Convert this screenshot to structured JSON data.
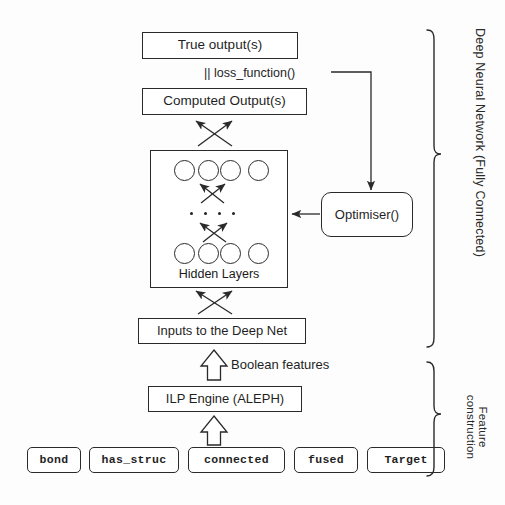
{
  "diagram": {
    "boxes": {
      "true_output": "True output(s)",
      "computed_output": "Computed Output(s)",
      "hidden_layers_caption": "Hidden Layers",
      "optimiser": "Optimiser()",
      "inputs_deep_net": "Inputs to the Deep Net",
      "ilp_engine": "ILP Engine (ALEPH)"
    },
    "labels": {
      "loss_function": "|| loss_function()",
      "boolean_features": "Boolean features"
    },
    "brackets": [
      {
        "name": "deep-neural-network",
        "label": "Deep Neural Network (Fully Connected)"
      },
      {
        "name": "feature-construction",
        "label": "Feature construction"
      }
    ],
    "feature_construction_label_lines": [
      "Feature",
      "construction"
    ],
    "predicates": [
      {
        "name": "bond",
        "label": "bond"
      },
      {
        "name": "has_struc",
        "label": "has_struc"
      },
      {
        "name": "connected",
        "label": "connected"
      },
      {
        "name": "fused",
        "label": "fused"
      },
      {
        "name": "target",
        "label": "Target"
      }
    ],
    "hidden_layer_nodes": {
      "top_row_count": 4,
      "bottom_row_count": 4,
      "ellipsis_dots": 4
    },
    "colors": {
      "stroke": "#2a2a2a",
      "text": "#1f1f1f",
      "background": "#fdfdfd"
    }
  }
}
